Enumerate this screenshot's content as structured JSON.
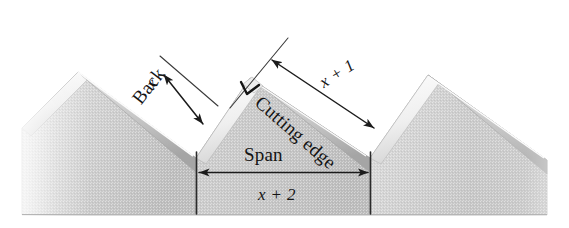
{
  "labels": {
    "back": "Back",
    "cutting_edge": "Cutting edge",
    "span": "Span",
    "dim_back": "x",
    "dim_cutting_edge": "x + 1",
    "dim_span": "x + 2"
  },
  "colors": {
    "paper": "#ffffff",
    "body_fill": "#c9c9c9",
    "body_fill_light": "#dcdcdc",
    "bevel_light": "#f2f2f2",
    "bevel_shadow": "#a8a8a8",
    "outline": "#8c8c8c",
    "ink": "#141414"
  },
  "geometry": {
    "left_tooth": {
      "peak": [
        78,
        72
      ],
      "valley_right": [
        196,
        158
      ]
    },
    "center_tooth": {
      "apex": [
        250,
        78
      ],
      "valley_left": [
        196,
        158
      ],
      "valley_right": [
        370,
        158
      ]
    },
    "right_tooth": {
      "peak": [
        428,
        75
      ],
      "valley_left": [
        370,
        158
      ]
    },
    "baseline_y": 215,
    "left_edge_x": 22,
    "right_edge_x": 547
  },
  "annotations": {
    "right_angle_marker": {
      "at": [
        250,
        88
      ],
      "meaning": "right-angle-between-back-and-cutting-edge"
    },
    "dimension_back": {
      "from": [
        202,
        123
      ],
      "to": [
        163,
        74
      ],
      "style": "double-arrow"
    },
    "dimension_cutting_edge": {
      "from": [
        372,
        126
      ],
      "to": [
        272,
        62
      ],
      "style": "double-arrow"
    },
    "dimension_span": {
      "from": [
        196,
        172
      ],
      "to": [
        370,
        172
      ],
      "style": "double-arrow"
    },
    "extension_lines": [
      {
        "from": [
          160,
          56
        ],
        "to": [
          216,
          104
        ]
      },
      {
        "from": [
          232,
          106
        ],
        "to": [
          288,
          40
        ]
      },
      {
        "from": [
          196,
          158
        ],
        "to": [
          196,
          214
        ]
      },
      {
        "from": [
          370,
          158
        ],
        "to": [
          370,
          214
        ]
      }
    ]
  }
}
